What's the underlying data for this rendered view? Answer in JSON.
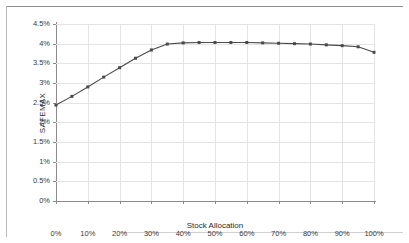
{
  "chart_data": {
    "type": "line",
    "title": "",
    "subtitle": "",
    "xlabel": "Stock Allocation",
    "ylabel": "SAFEMAX",
    "xlim": [
      0,
      100
    ],
    "ylim": [
      0,
      4.5
    ],
    "grid": true,
    "legend": null,
    "xtick_labels": [
      "0%",
      "10%",
      "20%",
      "30%",
      "40%",
      "50%",
      "60%",
      "70%",
      "80%",
      "90%",
      "100%"
    ],
    "xtick_values": [
      0,
      10,
      20,
      30,
      40,
      50,
      60,
      70,
      80,
      90,
      100
    ],
    "ytick_labels": [
      "0%",
      "0.5%",
      "1%",
      "1.5%",
      "2%",
      "2.5%",
      "3%",
      "3.5%",
      "4%",
      "4.5%"
    ],
    "ytick_values": [
      0,
      0.5,
      1,
      1.5,
      2,
      2.5,
      3,
      3.5,
      4,
      4.5
    ],
    "series": [
      {
        "name": "SAFEMAX",
        "color": "#4a4a4a",
        "marker": "square",
        "x": [
          0,
          5,
          10,
          15,
          20,
          25,
          30,
          35,
          40,
          45,
          50,
          55,
          60,
          65,
          70,
          75,
          80,
          85,
          90,
          95,
          100
        ],
        "values": [
          2.44,
          2.66,
          2.9,
          3.15,
          3.39,
          3.63,
          3.84,
          3.99,
          4.02,
          4.03,
          4.03,
          4.03,
          4.03,
          4.02,
          4.01,
          4.0,
          3.99,
          3.97,
          3.95,
          3.92,
          3.78
        ]
      }
    ],
    "annotations": []
  },
  "axis": {
    "axis_color": "#8a8a8a",
    "grid_color": "#e4e4e4",
    "tick_text_color": "#3a3a3a",
    "label_text_color": "#2b2b2b"
  },
  "page": {
    "background": "#ffffff",
    "rule_color": "#8c8c8c"
  }
}
